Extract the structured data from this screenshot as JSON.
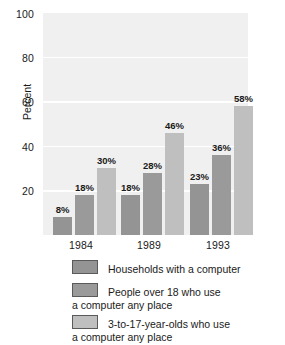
{
  "chart_data": {
    "type": "bar",
    "title": "",
    "xlabel": "",
    "ylabel": "Percent",
    "ylim": [
      0,
      100
    ],
    "yticks": [
      20,
      40,
      60,
      80,
      100
    ],
    "ytick_labels": [
      "20",
      "40",
      "60",
      "80",
      "100"
    ],
    "grid": true,
    "legend_position": "bottom",
    "categories": [
      "1984",
      "1989",
      "1993"
    ],
    "series": [
      {
        "name": "Households with a computer",
        "name_line1": "Households with a computer",
        "name_line2": "",
        "color": "#949494",
        "values": [
          8,
          18,
          23
        ],
        "labels": [
          "8%",
          "18%",
          "23%"
        ]
      },
      {
        "name": "People over 18 who use a computer any place",
        "name_line1": "People over 18 who use",
        "name_line2": "a computer any place",
        "color": "#9a9a9a",
        "values": [
          18,
          28,
          36
        ],
        "labels": [
          "18%",
          "28%",
          "36%"
        ]
      },
      {
        "name": "3-to-17-year-olds who use a computer any place",
        "name_line1": "3-to-17-year-olds who use",
        "name_line2": "a computer any place",
        "color": "#bfbfbf",
        "values": [
          30,
          46,
          58
        ],
        "labels": [
          "30%",
          "46%",
          "58%"
        ]
      }
    ],
    "plot_background": "#f0f0f0",
    "gridline_color": "#ffffff"
  }
}
